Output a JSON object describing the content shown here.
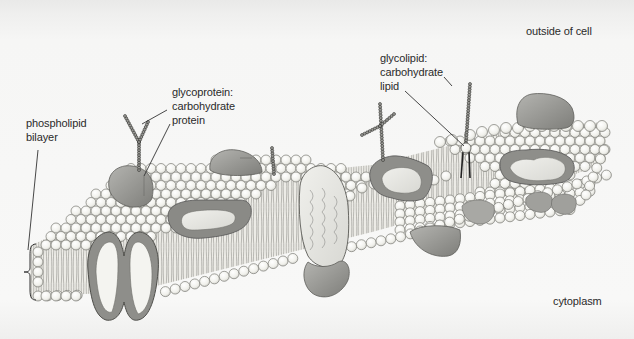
{
  "figure": {
    "regions": {
      "outside": "outside of cell",
      "inside": "cytoplasm"
    },
    "labels": {
      "phospholipid_bilayer": [
        "phospholipid",
        "bilayer"
      ],
      "glycoprotein": [
        "glycoprotein:",
        "carbohydrate",
        "protein"
      ],
      "glycolipid": [
        "glycolipid:",
        "carbohydrate",
        "lipid"
      ]
    },
    "components": [
      "phospholipid bilayer",
      "glycoprotein",
      "glycolipid",
      "peripheral protein",
      "integral protein",
      "channel protein",
      "cholesterol"
    ],
    "colors": {
      "background": "#f6f6f5",
      "head_fill": "#f7f7f2",
      "head_stroke": "#7a7a74",
      "protein_dark": "#8c8c88",
      "protein_mid": "#a9a9a5",
      "protein_light": "#e6e6e2",
      "text": "#2a2a2a"
    }
  }
}
